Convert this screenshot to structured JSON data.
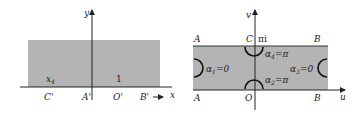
{
  "left_panel": {
    "axis_x_label": "x",
    "axis_y_label": "y",
    "region_fill": "#b4b4b4",
    "labels_above_axis": {
      "x4": "x",
      "x4_sub": "4",
      "one": "1"
    },
    "points": {
      "c_prime": "C'",
      "a_prime": "A'",
      "o_prime": "O'",
      "b_prime": "B'"
    }
  },
  "right_panel": {
    "axis_u_label": "u",
    "axis_v_label": "v",
    "region_fill": "#b4b4b4",
    "top_labels": {
      "a": "A",
      "c": "C",
      "pi_i": "πi",
      "b": "B"
    },
    "bottom_labels": {
      "a": "A",
      "o": "O",
      "b": "B"
    },
    "angles": {
      "alpha1": "α",
      "alpha1_sub": "1",
      "alpha1_val": "=0",
      "alpha2": "α",
      "alpha2_sub": "2",
      "alpha2_val": "=π",
      "alpha3": "α",
      "alpha3_sub": "3",
      "alpha3_val": "=0",
      "alpha4": "α",
      "alpha4_sub": "4",
      "alpha4_val": "=π"
    }
  }
}
